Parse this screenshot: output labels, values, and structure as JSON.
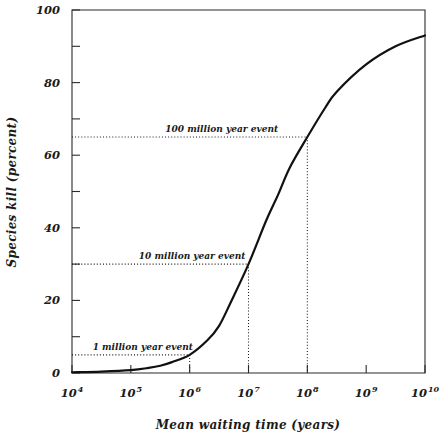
{
  "chart_data": {
    "type": "line",
    "title": "",
    "xlabel": "Mean waiting time (years)",
    "ylabel": "Species kill (percent)",
    "xscale": "log",
    "xlim": [
      10000,
      10000000000
    ],
    "ylim": [
      0,
      100
    ],
    "grid": false,
    "legend": null,
    "x_tick_labels": [
      {
        "mantissa": "10",
        "exponent": "4",
        "value": 10000
      },
      {
        "mantissa": "10",
        "exponent": "5",
        "value": 100000
      },
      {
        "mantissa": "10",
        "exponent": "6",
        "value": 1000000
      },
      {
        "mantissa": "10",
        "exponent": "7",
        "value": 10000000
      },
      {
        "mantissa": "10",
        "exponent": "8",
        "value": 100000000
      },
      {
        "mantissa": "10",
        "exponent": "9",
        "value": 1000000000
      },
      {
        "mantissa": "10",
        "exponent": "10",
        "value": 10000000000
      }
    ],
    "y_tick_labels": [
      "0",
      "20",
      "40",
      "60",
      "80",
      "100"
    ],
    "y_ticks_major": [
      0,
      20,
      40,
      60,
      80,
      100
    ],
    "y_ticks_minor": [
      10,
      30,
      50,
      70,
      90
    ],
    "series": [
      {
        "name": "species kill vs mean waiting time",
        "points": [
          {
            "x": 10000,
            "y": 0.2
          },
          {
            "x": 31623,
            "y": 0.4
          },
          {
            "x": 100000,
            "y": 0.8
          },
          {
            "x": 200000,
            "y": 1.4
          },
          {
            "x": 316228,
            "y": 2.0
          },
          {
            "x": 500000,
            "y": 3.0
          },
          {
            "x": 1000000,
            "y": 5.0
          },
          {
            "x": 2000000,
            "y": 9.0
          },
          {
            "x": 3162280,
            "y": 13.0
          },
          {
            "x": 5000000,
            "y": 19.5
          },
          {
            "x": 10000000,
            "y": 30.0
          },
          {
            "x": 20000000,
            "y": 42.0
          },
          {
            "x": 31622800,
            "y": 49.0
          },
          {
            "x": 50000000,
            "y": 56.5
          },
          {
            "x": 100000000,
            "y": 65.0
          },
          {
            "x": 200000000,
            "y": 73.0
          },
          {
            "x": 316228000,
            "y": 77.5
          },
          {
            "x": 1000000000,
            "y": 85.0
          },
          {
            "x": 3162280000,
            "y": 90.0
          },
          {
            "x": 10000000000,
            "y": 93.0
          }
        ]
      }
    ],
    "annotations": [
      {
        "label": "100 million year event",
        "x_value": 100000000,
        "y_value": 65,
        "label_x_value": 3500000,
        "guide": "both"
      },
      {
        "label": "10 million year event",
        "x_value": 10000000,
        "y_value": 30,
        "label_x_value": 1100000,
        "guide": "both"
      },
      {
        "label": "1 million year event",
        "x_value": 1000000,
        "y_value": 5,
        "label_x_value": 160000,
        "guide": "both"
      }
    ]
  }
}
